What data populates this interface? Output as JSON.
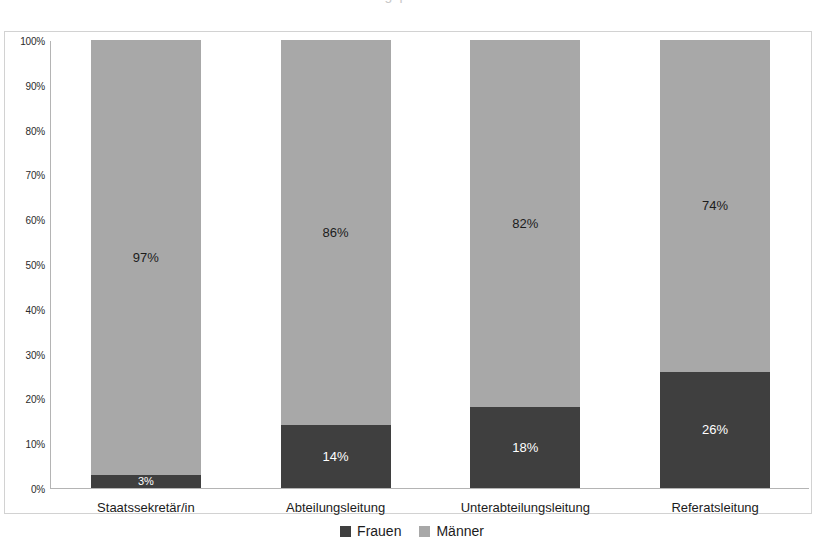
{
  "title_clipped": "Frauenanteil in Führungspositionen der obersten Bundesbehörden",
  "chart_data": {
    "type": "bar",
    "stacked": true,
    "stacked_mode": "percent",
    "title": "",
    "xlabel": "",
    "ylabel": "",
    "ylim": [
      0,
      100
    ],
    "grid": false,
    "legend_position": "bottom",
    "categories": [
      "Staatssekretär/in",
      "Abteilungsleitung",
      "Unterabteilungsleitung",
      "Referatsleitung"
    ],
    "ytick_labels": [
      "0%",
      "10%",
      "20%",
      "30%",
      "40%",
      "50%",
      "60%",
      "70%",
      "80%",
      "90%",
      "100%"
    ],
    "ytick_values": [
      0,
      10,
      20,
      30,
      40,
      50,
      60,
      70,
      80,
      90,
      100
    ],
    "series": [
      {
        "name": "Frauen",
        "color": "#3f3f3f",
        "values": [
          3,
          14,
          18,
          26
        ],
        "labels": [
          "3%",
          "14%",
          "18%",
          "26%"
        ]
      },
      {
        "name": "Männer",
        "color": "#a8a8a8",
        "values": [
          97,
          86,
          82,
          74
        ],
        "labels": [
          "97%",
          "86%",
          "82%",
          "74%"
        ]
      }
    ]
  },
  "legend": {
    "items": [
      {
        "label": "Frauen",
        "color": "#3f3f3f"
      },
      {
        "label": "Männer",
        "color": "#a8a8a8"
      }
    ]
  }
}
